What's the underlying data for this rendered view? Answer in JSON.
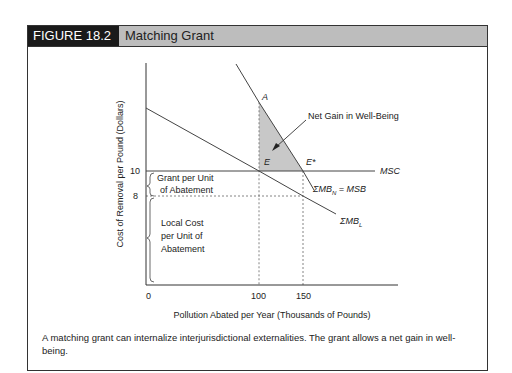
{
  "figure": {
    "number": "FIGURE 18.2",
    "title": "Matching Grant",
    "caption": "A matching grant can internalize interjurisdictional externalities. The grant allows a net gain in well-being."
  },
  "colors": {
    "header_dark": "#1a1a1a",
    "header_light": "#bdbdbd",
    "shaded_area": "#c8c8c8",
    "line": "#333333"
  },
  "chart_data": {
    "type": "line",
    "title": "Matching Grant",
    "xlabel": "Pollution Abated per Year (Thousands of Pounds)",
    "ylabel": "Cost of Removal per Pound (Dollars)",
    "x_ticks": [
      "0",
      "100",
      "150"
    ],
    "y_ticks": [
      "10",
      "8"
    ],
    "grid": false,
    "series": [
      {
        "name": "MSC",
        "label": "MSC",
        "points": [
          [
            0,
            10
          ],
          [
            210,
            10
          ]
        ]
      },
      {
        "name": "sum-mb-n",
        "label": "ΣMB_N = MSB",
        "points": [
          [
            75,
            19
          ],
          [
            100,
            15.5
          ],
          [
            150,
            10
          ],
          [
            165,
            8.3
          ]
        ]
      },
      {
        "name": "sum-mb-l",
        "label": "ΣMB_L",
        "points": [
          [
            0,
            15
          ],
          [
            100,
            10
          ],
          [
            150,
            8
          ],
          [
            205,
            6
          ]
        ]
      }
    ],
    "points": [
      {
        "label": "A",
        "x": 100,
        "y": 15.5
      },
      {
        "label": "E",
        "x": 100,
        "y": 10
      },
      {
        "label": "E*",
        "x": 150,
        "y": 10
      }
    ],
    "shaded_region": {
      "label": "Net Gain in Well-Being",
      "vertices": [
        [
          100,
          15.5
        ],
        [
          100,
          10
        ],
        [
          150,
          10
        ]
      ]
    },
    "reference_lines": [
      {
        "type": "vertical-dashed",
        "x": 100
      },
      {
        "type": "vertical-dashed",
        "x": 150
      },
      {
        "type": "horizontal-dashed",
        "y": 8
      }
    ],
    "annotations": [
      {
        "text": "Grant per Unit of Abatement",
        "range_y": [
          8,
          10
        ]
      },
      {
        "text": "Local Cost per Unit of Abatement",
        "range_y": [
          0,
          8
        ]
      },
      {
        "text": "Net Gain in Well-Being"
      }
    ]
  },
  "labels": {
    "msc": "MSC",
    "mbn_sigma": "ΣMB",
    "mbn_sub": "N",
    "mbn_eq": " = MSB",
    "mbl_sigma": "ΣMB",
    "mbl_sub": "L",
    "grant_line1": "Grant per Unit",
    "grant_line2": "of Abatement",
    "local_line1": "Local Cost",
    "local_line2": "per Unit of",
    "local_line3": "Abatement",
    "net_gain": "Net Gain in Well-Being"
  }
}
